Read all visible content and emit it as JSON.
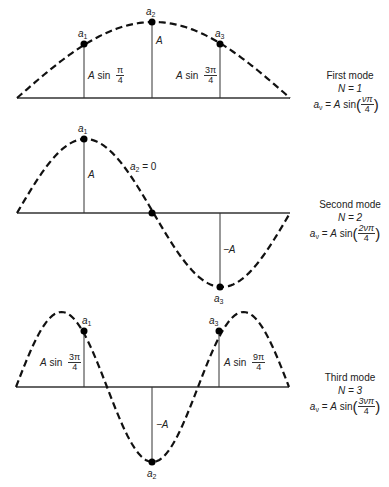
{
  "modes": [
    {
      "title": "First mode",
      "n_label": "N = 1",
      "formula": {
        "lhs": "a",
        "lhs_sub": "ν",
        "eq": "=",
        "amp": "A",
        "fn": "sin",
        "num": "νπ",
        "den": "4"
      },
      "points": [
        {
          "label": "a",
          "sub": "1",
          "value_expr": {
            "amp": "A",
            "fn": "sin",
            "num": "π",
            "den": "4"
          }
        },
        {
          "label": "a",
          "sub": "2",
          "value_expr": {
            "amp": "A"
          }
        },
        {
          "label": "a",
          "sub": "3",
          "value_expr": {
            "amp": "A",
            "fn": "sin",
            "num": "3π",
            "den": "4"
          }
        }
      ]
    },
    {
      "title": "Second mode",
      "n_label": "N = 2",
      "formula": {
        "lhs": "a",
        "lhs_sub": "ν",
        "eq": "=",
        "amp": "A",
        "fn": "sin",
        "num": "2νπ",
        "den": "4"
      },
      "points": [
        {
          "label": "a",
          "sub": "1",
          "value_expr": {
            "amp": "A"
          }
        },
        {
          "label": "a",
          "sub": "2",
          "value_expr": {
            "text": "= 0"
          }
        },
        {
          "label": "a",
          "sub": "3",
          "value_expr": {
            "amp": "−A"
          }
        }
      ]
    },
    {
      "title": "Third mode",
      "n_label": "N = 3",
      "formula": {
        "lhs": "a",
        "lhs_sub": "ν",
        "eq": "=",
        "amp": "A",
        "fn": "sin",
        "num": "3νπ",
        "den": "4"
      },
      "points": [
        {
          "label": "a",
          "sub": "1",
          "value_expr": {
            "amp": "A",
            "fn": "sin",
            "num": "3π",
            "den": "4"
          }
        },
        {
          "label": "a",
          "sub": "2",
          "value_expr": {
            "amp": "−A"
          }
        },
        {
          "label": "a",
          "sub": "3",
          "value_expr": {
            "amp": "A",
            "fn": "sin",
            "num": "9π",
            "den": "4"
          }
        }
      ]
    }
  ]
}
